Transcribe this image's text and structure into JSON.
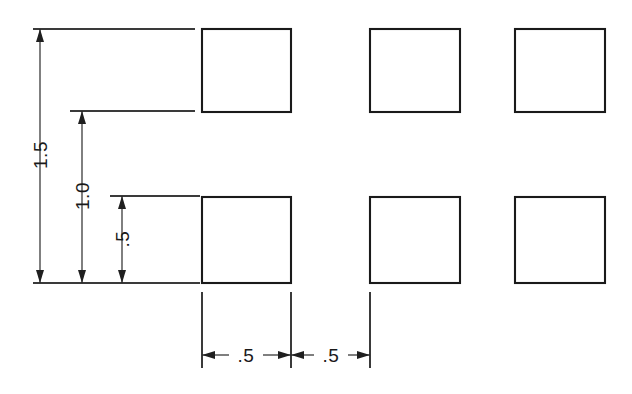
{
  "drawing": {
    "title": "Dimensioned square array",
    "background_color": "#ffffff",
    "line_color": "#1a1a1a",
    "extension_line_color": "#3a3a3a",
    "width": 632,
    "height": 394,
    "squares": [
      {
        "name": "square-top-left",
        "x": 202,
        "y": 29,
        "w": 89,
        "h": 83
      },
      {
        "name": "square-top-center",
        "x": 370,
        "y": 29,
        "w": 90,
        "h": 83
      },
      {
        "name": "square-top-right",
        "x": 515,
        "y": 29,
        "w": 90,
        "h": 83
      },
      {
        "name": "square-bottom-left",
        "x": 202,
        "y": 197,
        "w": 89,
        "h": 86
      },
      {
        "name": "square-bottom-center",
        "x": 370,
        "y": 197,
        "w": 90,
        "h": 86
      },
      {
        "name": "square-bottom-right",
        "x": 515,
        "y": 197,
        "w": 90,
        "h": 86
      }
    ],
    "vertical_dimensions": [
      {
        "name": "dim-1-5",
        "label": "1.5",
        "line_x": 40,
        "top_y": 29,
        "bottom_y": 283,
        "ext_left": 33,
        "ext_right": 195,
        "text_y": 155
      },
      {
        "name": "dim-1-0",
        "label": "1.0",
        "line_x": 82,
        "top_y": 111,
        "bottom_y": 283,
        "ext_left": 70,
        "ext_right": 195,
        "text_y": 196
      },
      {
        "name": "dim-0-5",
        "label": ".5",
        "line_x": 122,
        "top_y": 196,
        "bottom_y": 283,
        "ext_left": 110,
        "ext_right": 200,
        "text_y": 239
      }
    ],
    "vertical_baseline": {
      "name": "datum-baseline",
      "y": 283,
      "x_start": 33,
      "x_end": 200
    },
    "horizontal_dimensions": [
      {
        "name": "dim-width-left",
        "label": ".5",
        "left_x": 202,
        "right_x": 291,
        "line_y": 355,
        "text_x": 246
      },
      {
        "name": "dim-width-right",
        "label": ".5",
        "left_x": 291,
        "right_x": 370,
        "line_y": 355,
        "text_x": 331
      }
    ],
    "horizontal_extension_lines": [
      {
        "name": "ext-line-x-202",
        "x": 202,
        "y_start": 292,
        "y_end": 368
      },
      {
        "name": "ext-line-x-291",
        "x": 291,
        "y_start": 292,
        "y_end": 368
      },
      {
        "name": "ext-line-x-370",
        "x": 370,
        "y_start": 292,
        "y_end": 368
      }
    ]
  }
}
